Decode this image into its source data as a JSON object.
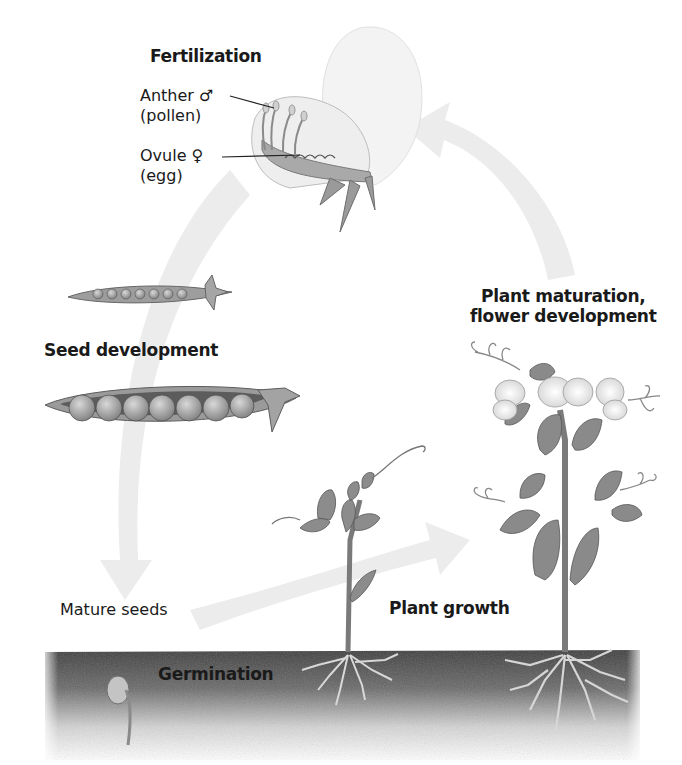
{
  "diagram": {
    "stages": {
      "fertilization": {
        "label": "Fertilization"
      },
      "anther": {
        "label": "Anther ♂",
        "sub": "(pollen)"
      },
      "ovule": {
        "label": "Ovule ♀",
        "sub": "(egg)"
      },
      "seed_development": {
        "label": "Seed development"
      },
      "mature_seeds": {
        "label": "Mature seeds"
      },
      "germination": {
        "label": "Germination"
      },
      "plant_growth": {
        "label": "Plant growth"
      },
      "plant_maturation": {
        "label": "Plant maturation,\nflower development"
      }
    },
    "cycle_order": [
      "Fertilization",
      "Seed development",
      "Mature seeds",
      "Germination",
      "Plant growth",
      "Plant maturation, flower development"
    ],
    "colors": {
      "text": "#1a1a1a",
      "arrow": "#ececec",
      "soil_top": "#4a4a4a",
      "soil_bottom": "#f2f2f2",
      "leaf": "#8a8a8a",
      "pod": "#9a9a9a"
    }
  }
}
